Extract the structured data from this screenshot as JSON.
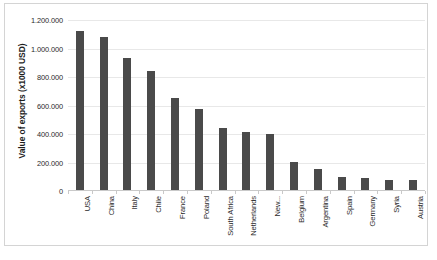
{
  "chart_data": {
    "type": "bar",
    "title": "",
    "xlabel": "",
    "ylabel": "Value of exports (x1000 USD)",
    "ylim": [
      0,
      1200000
    ],
    "ytick_step": 200000,
    "ytick_labels": [
      "1.200.000",
      "1.000.000",
      "800.000",
      "600.000",
      "400.000",
      "200.000",
      "0"
    ],
    "ytick_values": [
      1200000,
      1000000,
      800000,
      600000,
      400000,
      200000,
      0
    ],
    "grid": "horizontal",
    "legend": "none",
    "bar_color": "#4a4a4a",
    "number_format": "european-dot-thousands",
    "categories": [
      "USA",
      "China",
      "Italy",
      "Chile",
      "France",
      "Poland",
      "South Africa",
      "Netherlands",
      "New...",
      "Belgium",
      "Argentina",
      "Spain",
      "Germany",
      "Syria",
      "Austria"
    ],
    "values": [
      1123000,
      1080000,
      932000,
      845000,
      650000,
      578000,
      440000,
      415000,
      403000,
      203000,
      152000,
      95000,
      88000,
      78000,
      77000
    ]
  },
  "colors": {
    "bar": "#4a4a4a",
    "gridline": "#e8e8e8",
    "axis": "#c9c9c9",
    "border": "#d4d4d4",
    "text": "#2b2b2b",
    "background": "#ffffff"
  }
}
